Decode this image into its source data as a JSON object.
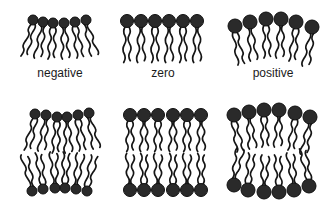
{
  "figure": {
    "colors": {
      "head": "#2a2a2a",
      "tail": "#151515",
      "background": "#ffffff",
      "text": "#1a1a1a"
    },
    "labels": [
      {
        "text": "negative",
        "cx": 60
      },
      {
        "text": "zero",
        "cx": 163
      },
      {
        "text": "positive",
        "cx": 273
      }
    ],
    "monolayers": [
      {
        "name": "negative",
        "head_radius": 5,
        "tail_length": 32,
        "heads": [
          [
            33,
            20
          ],
          [
            43,
            22
          ],
          [
            53,
            23
          ],
          [
            64,
            23
          ],
          [
            75,
            22
          ],
          [
            86,
            20
          ]
        ]
      },
      {
        "name": "zero",
        "head_radius": 6.5,
        "tail_length": 36,
        "heads": [
          [
            127,
            21
          ],
          [
            141,
            21
          ],
          [
            155,
            21
          ],
          [
            169,
            21
          ],
          [
            183,
            21
          ],
          [
            197,
            21
          ]
        ]
      },
      {
        "name": "positive",
        "head_radius": 7,
        "tail_length": 33,
        "heads": [
          [
            235,
            26
          ],
          [
            250,
            22
          ],
          [
            266,
            19
          ],
          [
            281,
            19
          ],
          [
            296,
            22
          ],
          [
            312,
            27
          ]
        ]
      }
    ],
    "bilayers": [
      {
        "name": "negative",
        "head_radius": 5,
        "tail_length": 32,
        "top_heads": [
          [
            35,
            114
          ],
          [
            46,
            115
          ],
          [
            57,
            117
          ],
          [
            67,
            117
          ],
          [
            78,
            115
          ],
          [
            89,
            113
          ]
        ],
        "bottom_heads": [
          [
            32,
            191
          ],
          [
            43,
            189
          ],
          [
            55,
            188
          ],
          [
            65,
            188
          ],
          [
            76,
            189
          ],
          [
            87,
            191
          ]
        ]
      },
      {
        "name": "zero",
        "head_radius": 6.5,
        "tail_length": 31,
        "top_heads": [
          [
            130,
            115
          ],
          [
            144,
            115
          ],
          [
            158,
            115
          ],
          [
            173,
            115
          ],
          [
            187,
            115
          ],
          [
            201,
            115
          ]
        ],
        "bottom_heads": [
          [
            130,
            190
          ],
          [
            144,
            190
          ],
          [
            158,
            190
          ],
          [
            173,
            190
          ],
          [
            187,
            190
          ],
          [
            201,
            190
          ]
        ]
      },
      {
        "name": "positive",
        "head_radius": 7,
        "tail_length": 31,
        "top_heads": [
          [
            234,
            115
          ],
          [
            249,
            112
          ],
          [
            264,
            110
          ],
          [
            279,
            110
          ],
          [
            295,
            113
          ],
          [
            310,
            117
          ]
        ],
        "bottom_heads": [
          [
            234,
            185
          ],
          [
            248,
            190
          ],
          [
            264,
            192
          ],
          [
            279,
            192
          ],
          [
            294,
            190
          ],
          [
            309,
            186
          ]
        ]
      }
    ]
  }
}
